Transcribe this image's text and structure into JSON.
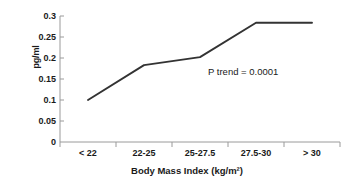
{
  "chart_data": {
    "type": "line",
    "title": "",
    "subtitle": "",
    "xlabel": "Body Mass Index (kg/m²)",
    "ylabel": "pg/ml",
    "categories": [
      "< 22",
      "22-25",
      "25-27.5",
      "27.5-30",
      "> 30"
    ],
    "values": [
      0.1,
      0.183,
      0.202,
      0.284,
      0.284
    ],
    "series": [
      {
        "name": "",
        "values": [
          0.1,
          0.183,
          0.202,
          0.284,
          0.284
        ]
      }
    ],
    "ylim": [
      0,
      0.3
    ],
    "yticks": [
      "0",
      "0.05",
      "0.1",
      "0.15",
      "0.2",
      "0.25",
      "0.3"
    ],
    "ytick_values": [
      0,
      0.05,
      0.1,
      0.15,
      0.2,
      0.25,
      0.3
    ],
    "grid": false,
    "legend": "none",
    "annotations": [
      {
        "text": "P trend = 0.0001",
        "x": "25-27.5",
        "y": 0.155
      }
    ],
    "line_color": "#333333",
    "axis_color": "#808080",
    "markers": false
  },
  "axis": {
    "y_label": "pg/ml",
    "x_label": "Body Mass Index (kg/m²)",
    "y_ticks": [
      "0.3",
      "0.25",
      "0.2",
      "0.15",
      "0.1",
      "0.05",
      "0"
    ],
    "x_ticks": [
      "< 22",
      "22-25",
      "25-27.5",
      "27.5-30",
      "> 30"
    ]
  },
  "annotation": {
    "p_trend": "P trend = 0.0001"
  }
}
